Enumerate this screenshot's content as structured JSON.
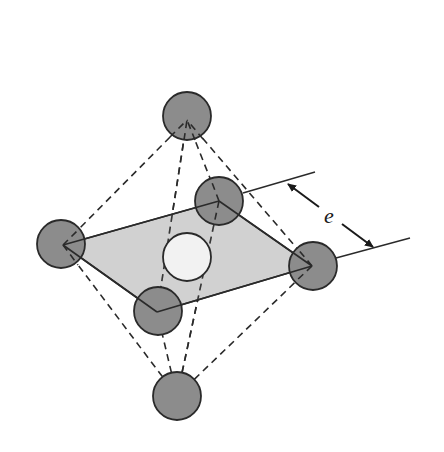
{
  "figure": {
    "colors": {
      "background": "#ffffff",
      "atom_fill": "#8c8c8c",
      "interstitial_fill": "#f2f2f2",
      "plane_fill": "#c9c9c9",
      "line": "#2a2a2a"
    },
    "atoms": [
      {
        "id": "top",
        "cx": 187,
        "cy": 116,
        "r": 24,
        "vx": 187,
        "vy": 120
      },
      {
        "id": "left",
        "cx": 61,
        "cy": 244,
        "r": 24,
        "vx": 63,
        "vy": 245
      },
      {
        "id": "back",
        "cx": 219,
        "cy": 201,
        "r": 24,
        "vx": 219,
        "vy": 201
      },
      {
        "id": "right",
        "cx": 313,
        "cy": 266,
        "r": 24,
        "vx": 312,
        "vy": 266
      },
      {
        "id": "front",
        "cx": 158,
        "cy": 311,
        "r": 24,
        "vx": 157,
        "vy": 312
      },
      {
        "id": "bottom",
        "cx": 177,
        "cy": 396,
        "r": 24,
        "vx": 177,
        "vy": 396
      }
    ],
    "interstitial": {
      "cx": 187,
      "cy": 257,
      "r": 24
    },
    "dimension": {
      "label": "e",
      "upper_line": {
        "x1": 243,
        "y1": 193,
        "x2": 315,
        "y2": 172
      },
      "lower_line": {
        "x1": 336,
        "y1": 258,
        "x2": 410,
        "y2": 238
      },
      "arrow": {
        "x1": 286,
        "y1": 183,
        "x2": 375,
        "y2": 248
      },
      "label_pos": {
        "x": 330,
        "y": 222
      }
    }
  }
}
